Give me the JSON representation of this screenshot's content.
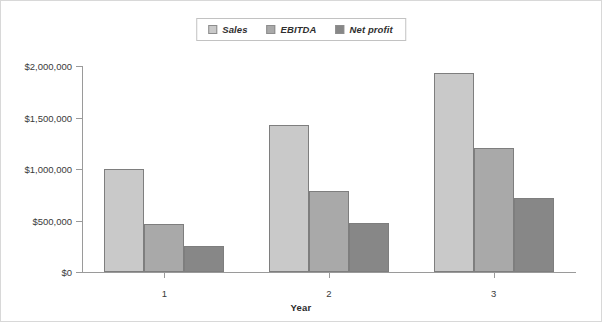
{
  "chart_data": {
    "type": "bar",
    "title": "",
    "subtitle": "",
    "xlabel": "Year",
    "ylabel": "",
    "categories": [
      "1",
      "2",
      "3"
    ],
    "series": [
      {
        "name": "Sales",
        "color": "#c9c9c9",
        "values": [
          1000000,
          1430000,
          1930000
        ]
      },
      {
        "name": "EBITDA",
        "color": "#a9a9a9",
        "values": [
          470000,
          790000,
          1200000
        ]
      },
      {
        "name": "Net profit",
        "color": "#878787",
        "values": [
          250000,
          480000,
          720000
        ]
      }
    ],
    "ylim": [
      0,
      2000000
    ],
    "ytick_values": [
      0,
      500000,
      1000000,
      1500000,
      2000000
    ],
    "ytick_labels": [
      "$0",
      "$500,000",
      "$1,000,000",
      "$1,500,000",
      "$2,000,000"
    ],
    "grid": false,
    "legend_position": "top-center",
    "orientation": "vertical",
    "grouping": "clustered"
  },
  "legend": {
    "entries": [
      {
        "label": "Sales"
      },
      {
        "label": "EBITDA"
      },
      {
        "label": "Net profit"
      }
    ]
  },
  "axis": {
    "x_title": "Year"
  }
}
